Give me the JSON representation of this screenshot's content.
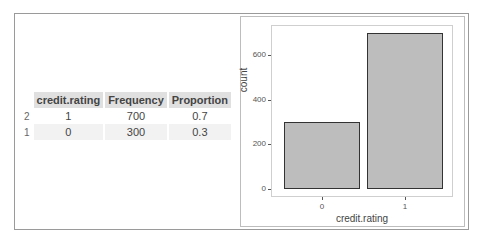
{
  "table": {
    "columns": [
      "credit.rating",
      "Frequency",
      "Proportion"
    ],
    "rows": [
      {
        "rowname": "2",
        "credit_rating": "1",
        "frequency": "700",
        "proportion": "0.7"
      },
      {
        "rowname": "1",
        "credit_rating": "0",
        "frequency": "300",
        "proportion": "0.3"
      }
    ]
  },
  "chart_data": {
    "type": "bar",
    "categories": [
      "0",
      "1"
    ],
    "values": [
      300,
      700
    ],
    "title": "",
    "xlabel": "credit.rating",
    "ylabel": "count",
    "yticks": [
      "0",
      "200",
      "400",
      "600"
    ],
    "ylim": [
      0,
      735
    ],
    "grid": false,
    "bar_fill": "#bdbdbd",
    "bar_edge": "#333333"
  }
}
